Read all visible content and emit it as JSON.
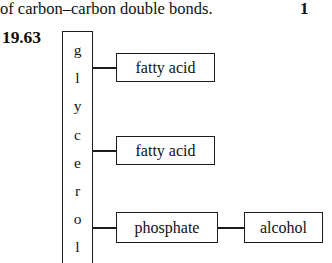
{
  "page": {
    "running_text": "of carbon–carbon double bonds.",
    "cut_off_number": "1"
  },
  "exercise": {
    "number": "19.63"
  },
  "figure": {
    "name": "phospholipid-structure-diagram",
    "backbone": {
      "label": "glycerol",
      "letters": [
        "g",
        "l",
        "y",
        "c",
        "e",
        "r",
        "o",
        "l"
      ]
    },
    "nodes": {
      "fatty_acid_1": "fatty acid",
      "fatty_acid_2": "fatty acid",
      "phosphate": "phosphate",
      "alcohol": "alcohol"
    },
    "colors": {
      "stroke": "#1c1c1c",
      "background": "#ffffff",
      "text": "#121212"
    }
  }
}
